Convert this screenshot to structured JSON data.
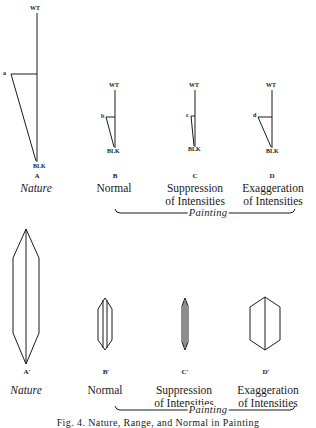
{
  "top_row": {
    "diagrams": [
      {
        "id": "A",
        "letter": "A",
        "label_lines": [
          "Nature"
        ],
        "italic": true,
        "top_mark": "WT",
        "bottom_mark": "BLK",
        "point_label": "a"
      },
      {
        "id": "B",
        "letter": "B",
        "label_lines": [
          "Normal"
        ],
        "italic": false,
        "top_mark": "WT",
        "bottom_mark": "BLK",
        "point_label": "b"
      },
      {
        "id": "C",
        "letter": "C",
        "label_lines": [
          "Suppression",
          "of Intensities"
        ],
        "italic": false,
        "top_mark": "WT",
        "bottom_mark": "BLK",
        "point_label": "c"
      },
      {
        "id": "D",
        "letter": "D",
        "label_lines": [
          "Exaggeration",
          "of Intensities"
        ],
        "italic": false,
        "top_mark": "WT",
        "bottom_mark": "BLK",
        "point_label": "d"
      }
    ],
    "brace_label": "Painting"
  },
  "bottom_row": {
    "diagrams": [
      {
        "id": "A-prime",
        "letter": "A′",
        "label_lines": [
          "Nature"
        ],
        "italic": true
      },
      {
        "id": "B-prime",
        "letter": "B′",
        "label_lines": [
          "Normal"
        ],
        "italic": false
      },
      {
        "id": "C-prime",
        "letter": "C′",
        "label_lines": [
          "Suppression",
          "of Intensities"
        ],
        "italic": false
      },
      {
        "id": "D-prime",
        "letter": "D′",
        "label_lines": [
          "Exaggeration",
          "of Intensities"
        ],
        "italic": false
      }
    ],
    "brace_label": "Painting"
  },
  "caption": "Fig. 4. Nature, Range, and Normal in Painting",
  "colors": {
    "ink": "#1a1a1a",
    "background": "#ffffff"
  }
}
